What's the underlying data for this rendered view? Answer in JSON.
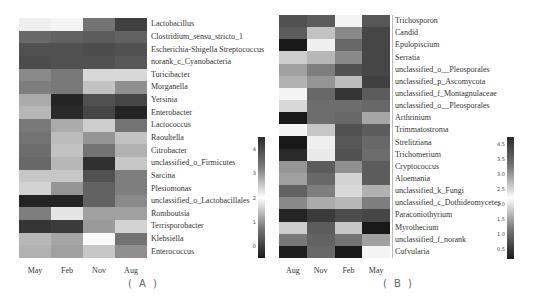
{
  "chart_data": [
    {
      "type": "heatmap",
      "panel_label": "( A )",
      "columns": [
        "May",
        "Feb",
        "Nov",
        "Aug"
      ],
      "rows": [
        "Lactobacillus",
        "Clostridium_sensu_stricto_1",
        "Escherichia-Shigella Streptococcus",
        "norank_c_Cyanobacteria",
        "Turicibacter",
        "Morganella",
        "Yersinia",
        "Enterobacter",
        "Lactococcus",
        "Raoultella",
        "Citrobacter",
        "unclassified_o_Firmicutes",
        "Sarcina",
        "Plesiomonas",
        "unclassified_o_Lactobacillales",
        "Romboutsia",
        "Terrisporobacter",
        "Klebsiella",
        "Enterococcus"
      ],
      "values": [
        [
          2.2,
          2.05,
          0.9,
          0.45
        ],
        [
          0.8,
          0.75,
          0.7,
          0.75
        ],
        [
          0.6,
          0.6,
          0.55,
          0.6
        ],
        [
          0.55,
          0.6,
          0.6,
          0.65
        ],
        [
          1.1,
          0.95,
          2.4,
          1.8
        ],
        [
          1.0,
          0.95,
          1.6,
          1.15
        ],
        [
          1.4,
          0.2,
          0.6,
          0.5
        ],
        [
          1.5,
          0.25,
          0.5,
          0.2
        ],
        [
          0.95,
          1.4,
          2.5,
          0.9
        ],
        [
          0.9,
          2.65,
          1.2,
          2.6
        ],
        [
          0.85,
          2.6,
          3.3,
          2.75
        ],
        [
          0.8,
          1.5,
          3.9,
          2.55
        ],
        [
          2.55,
          1.65,
          3.6,
          3.2
        ],
        [
          1.75,
          1.2,
          0.75,
          1.0
        ],
        [
          0.2,
          0.2,
          0.75,
          1.1
        ],
        [
          3.2,
          2.3,
          1.3,
          1.3
        ],
        [
          0.35,
          0.4,
          1.25,
          1.75
        ],
        [
          1.5,
          1.35,
          2.1,
          0.9
        ],
        [
          1.45,
          1.3,
          2.55,
          1.15
        ],
        [
          1.7,
          0.3,
          1.75,
          1.65
        ]
      ],
      "colorbar": {
        "ticks": [
          "4",
          "3",
          "2",
          "1",
          "0"
        ],
        "min": -0.2,
        "max": 4.6
      },
      "colormap": "diverging gray: dark (low/high) to white (middle ~2)"
    },
    {
      "type": "heatmap",
      "panel_label": "( B )",
      "columns": [
        "Aug",
        "Nov",
        "Feb",
        "May"
      ],
      "rows": [
        "Trichosporon",
        "Candid",
        "Epulopiscium",
        "Serratia",
        "unclassified_o__Pleosporales",
        "unclassified_p_Ascomycota",
        "unclassified_f_Montagnulaceae",
        "unclassified_o__Pleosporales",
        "Arthrinium",
        "Trimmatostroma",
        "Strelitziana",
        "Trichomerium",
        "Cryptococcus",
        "Aloemania",
        "unclassified_k_Fungi",
        "unclassified_c_Dothideomycetes",
        "Paraconiothyrium",
        "Myrothecium",
        "unclassified_f_norank",
        "Cufvularia"
      ],
      "values": [
        [
          0.7,
          0.8,
          2.25,
          0.75
        ],
        [
          0.8,
          1.7,
          1.2,
          0.6
        ],
        [
          0.2,
          2.1,
          0.9,
          0.6
        ],
        [
          1.8,
          1.6,
          1.2,
          0.6
        ],
        [
          1.4,
          1.1,
          0.7,
          0.6
        ],
        [
          1.55,
          1.3,
          1.65,
          0.55
        ],
        [
          2.15,
          0.9,
          0.45,
          0.8
        ],
        [
          1.9,
          0.95,
          0.95,
          0.9
        ],
        [
          0.2,
          0.95,
          0.9,
          1.45
        ],
        [
          2.25,
          1.75,
          0.7,
          0.8
        ],
        [
          0.2,
          2.1,
          0.75,
          0.9
        ],
        [
          0.35,
          2.05,
          0.7,
          0.95
        ],
        [
          1.3,
          0.8,
          1.25,
          0.8
        ],
        [
          1.4,
          0.9,
          1.85,
          0.8
        ],
        [
          0.85,
          1.1,
          1.9,
          1.55
        ],
        [
          1.2,
          1.5,
          1.6,
          1.1
        ],
        [
          0.3,
          0.5,
          0.65,
          0.6
        ],
        [
          1.8,
          0.8,
          1.75,
          0.2
        ],
        [
          1.05,
          0.85,
          1.0,
          1.4
        ],
        [
          0.25,
          0.9,
          0.15,
          2.25
        ]
      ],
      "colorbar": {
        "ticks": [
          "4.5",
          "3.5",
          "3.0",
          "2.5",
          "2.0",
          "1.5",
          "1.0",
          "0.5"
        ],
        "min": 0.2,
        "max": 4.8
      },
      "colormap": "diverging gray: dark (low/high) to white (middle ~2.3)"
    }
  ]
}
